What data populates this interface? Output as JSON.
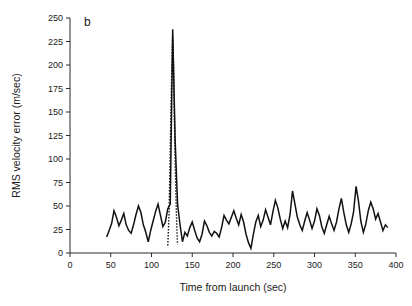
{
  "figure": {
    "panel_label": "b",
    "background_color": "#ffffff",
    "line_color": "#111111"
  },
  "chart_data": {
    "type": "line",
    "title": "",
    "subtitle": "",
    "panel_label": "b",
    "xlabel": "Time from launch (sec)",
    "ylabel": "RMS velocity error (m/sec)",
    "xlim": [
      0,
      400
    ],
    "ylim": [
      0,
      250
    ],
    "xticks": [
      0,
      50,
      100,
      150,
      200,
      250,
      300,
      350,
      400
    ],
    "xtick_labels": [
      "0",
      "50",
      "100",
      "150",
      "200",
      "250",
      "300",
      "350",
      "400"
    ],
    "yticks": [
      0,
      25,
      50,
      75,
      100,
      125,
      150,
      175,
      200,
      225,
      250
    ],
    "ytick_labels": [
      "0",
      "25",
      "50",
      "75",
      "100",
      "125",
      "150",
      "175",
      "200",
      "225",
      "250"
    ],
    "grid": false,
    "legend": null,
    "legend_position": "none",
    "annotations": [],
    "series": [
      {
        "name": "RMS velocity error (solid)",
        "style": "solid",
        "color": "#111111",
        "x": [
          45,
          48,
          51,
          54,
          57,
          60,
          63,
          66,
          69,
          72,
          75,
          78,
          81,
          84,
          87,
          90,
          93,
          96,
          99,
          102,
          105,
          108,
          111,
          114,
          117,
          120,
          123,
          126,
          129,
          132,
          135,
          138,
          141,
          144,
          147,
          150,
          153,
          156,
          159,
          162,
          165,
          168,
          171,
          174,
          177,
          180,
          183,
          186,
          189,
          192,
          195,
          198,
          201,
          204,
          207,
          210,
          213,
          216,
          219,
          222,
          225,
          228,
          231,
          234,
          237,
          240,
          243,
          246,
          249,
          252,
          255,
          258,
          261,
          264,
          267,
          270,
          273,
          276,
          279,
          282,
          285,
          288,
          291,
          294,
          297,
          300,
          303,
          306,
          309,
          312,
          315,
          318,
          321,
          324,
          327,
          330,
          333,
          336,
          339,
          342,
          345,
          348,
          351,
          354,
          357,
          360,
          363,
          366,
          369,
          372,
          375,
          378,
          381,
          384,
          387,
          390
        ],
        "y": [
          17,
          24,
          31,
          45,
          38,
          29,
          35,
          42,
          30,
          24,
          21,
          30,
          41,
          50,
          43,
          30,
          22,
          12,
          24,
          34,
          44,
          52,
          40,
          28,
          33,
          47,
          52,
          238,
          120,
          52,
          30,
          12,
          22,
          18,
          27,
          33,
          24,
          16,
          12,
          20,
          34,
          29,
          22,
          18,
          23,
          21,
          17,
          27,
          40,
          35,
          31,
          38,
          45,
          37,
          30,
          41,
          33,
          20,
          11,
          5,
          20,
          33,
          40,
          28,
          35,
          46,
          38,
          30,
          44,
          56,
          48,
          36,
          26,
          34,
          27,
          41,
          66,
          52,
          38,
          30,
          24,
          34,
          43,
          35,
          26,
          34,
          47,
          40,
          28,
          21,
          30,
          39,
          31,
          24,
          33,
          47,
          58,
          43,
          30,
          22,
          31,
          44,
          71,
          55,
          33,
          22,
          31,
          45,
          54,
          47,
          36,
          42,
          33,
          24,
          30,
          27
        ]
      },
      {
        "name": "RMS velocity error (dotted overlay)",
        "style": "dotted",
        "color": "#111111",
        "x": [
          120,
          121.5,
          123,
          124.5,
          126,
          127,
          128,
          129,
          130,
          131,
          132
        ],
        "y": [
          8,
          40,
          110,
          180,
          232,
          200,
          150,
          100,
          60,
          30,
          9
        ]
      }
    ]
  }
}
